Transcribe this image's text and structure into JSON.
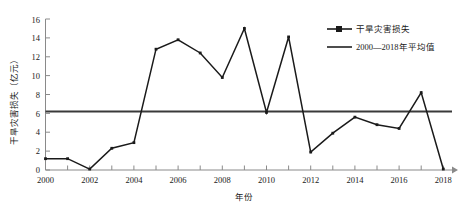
{
  "chart_data": {
    "type": "line",
    "title": "",
    "xlabel": "年份",
    "ylabel": "干旱灾害损失（亿元）",
    "x": [
      2000,
      2001,
      2002,
      2003,
      2004,
      2005,
      2006,
      2007,
      2008,
      2009,
      2010,
      2011,
      2012,
      2013,
      2014,
      2015,
      2016,
      2017,
      2018
    ],
    "xlim": [
      2000,
      2018
    ],
    "ylim": [
      0,
      16
    ],
    "xticks": [
      2000,
      2002,
      2004,
      2006,
      2008,
      2010,
      2012,
      2014,
      2016,
      2018
    ],
    "xtick_labels": [
      "2000",
      "2002",
      "2004",
      "2006",
      "2008",
      "2010",
      "2012",
      "2014",
      "2016",
      "2018"
    ],
    "xminor_ticks": [
      2001,
      2003,
      2005,
      2007,
      2009,
      2011,
      2013,
      2015,
      2017
    ],
    "yticks": [
      0,
      2,
      4,
      6,
      8,
      10,
      12,
      14,
      16
    ],
    "ytick_labels": [
      "0",
      "2",
      "4",
      "6",
      "8",
      "10",
      "12",
      "14",
      "16"
    ],
    "grid": false,
    "legend_position": "upper-right",
    "series": [
      {
        "name": "干旱灾害损失",
        "marker": "line-with-dot",
        "color": "#1a1a1a",
        "values": [
          1.2,
          1.2,
          0.1,
          2.3,
          2.9,
          12.8,
          13.8,
          12.4,
          9.8,
          15.0,
          6.1,
          14.1,
          1.9,
          3.9,
          5.6,
          4.8,
          4.4,
          8.2,
          0.1
        ]
      },
      {
        "name": "2000—2018年平均值",
        "marker": "line",
        "color": "#3a3a3a",
        "constant_value": 6.2
      }
    ]
  },
  "legend": {
    "items": [
      {
        "label": "干旱灾害损失",
        "style": "line-marker"
      },
      {
        "label": "2000—2018年平均值",
        "style": "line"
      }
    ]
  },
  "axes": {
    "y_axis_title": "干旱灾害损失（亿元）",
    "x_axis_title": "年份"
  }
}
